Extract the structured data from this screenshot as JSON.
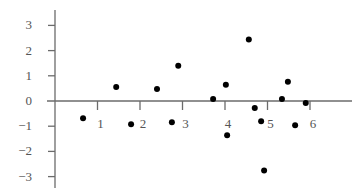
{
  "chart_data": {
    "type": "scatter",
    "title": "",
    "xlabel": "",
    "ylabel": "",
    "xlim": [
      0,
      7.2
    ],
    "ylim": [
      -3.5,
      3.5
    ],
    "grid": false,
    "legend": null,
    "x_ticks": [
      1,
      2,
      3,
      4,
      5,
      6
    ],
    "x_tick_labels": [
      "1",
      "2",
      "3",
      "4",
      "5",
      "6"
    ],
    "y_ticks": [
      3,
      2,
      1,
      0,
      -1,
      -2,
      -3
    ],
    "y_tick_labels": [
      "3",
      "2",
      "1",
      "0",
      "−1",
      "−2",
      "−3"
    ],
    "series": [
      {
        "name": "points",
        "color": "#000000",
        "x": [
          0.66,
          1.44,
          1.79,
          2.4,
          2.75,
          2.9,
          3.72,
          4.02,
          4.05,
          4.56,
          4.7,
          4.85,
          4.92,
          5.34,
          5.48,
          5.65,
          5.9
        ],
        "y": [
          -0.68,
          0.56,
          -0.92,
          0.48,
          -0.84,
          1.4,
          0.08,
          0.64,
          -1.36,
          2.44,
          -0.28,
          -0.8,
          -2.76,
          0.08,
          0.76,
          -0.96,
          -0.08
        ]
      }
    ]
  },
  "colors": {
    "axis": "#6b6b6b",
    "points": "#000000",
    "labels": "#555555"
  }
}
